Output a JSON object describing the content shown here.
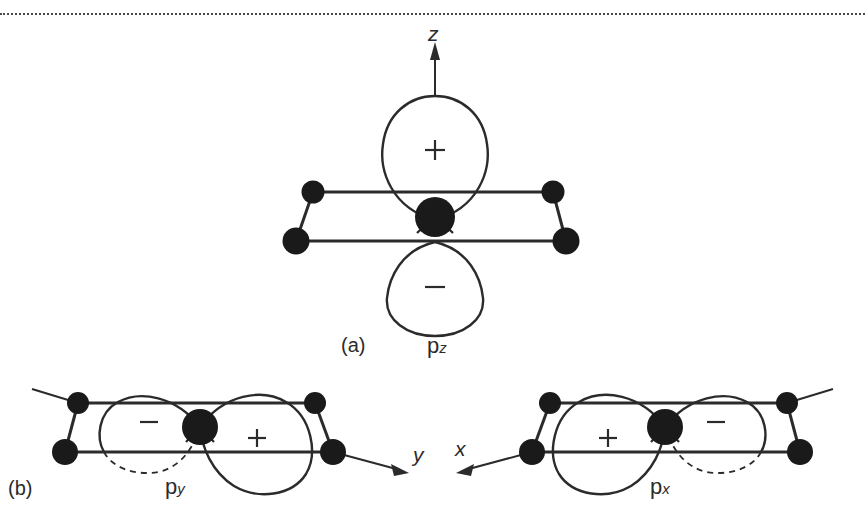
{
  "figure": {
    "type": "diagram",
    "panels": [
      {
        "id": "a",
        "panel_label": "(a)",
        "orbital_label": "p",
        "orbital_subscript": "z",
        "axis_label": "z",
        "axis_direction": "up",
        "lobes": [
          {
            "sign": "+",
            "position": "above-plane",
            "hidden": false
          },
          {
            "sign": "−",
            "position": "below-plane",
            "hidden": false
          }
        ],
        "central_atom": true,
        "corner_atoms": 4
      },
      {
        "id": "b-left",
        "panel_label": "(b)",
        "orbital_label": "p",
        "orbital_subscript": "y",
        "axis_label": "y",
        "axis_direction": "right",
        "lobes": [
          {
            "sign": "−",
            "position": "left",
            "hidden": true
          },
          {
            "sign": "+",
            "position": "right",
            "hidden": false
          }
        ],
        "central_atom": true,
        "corner_atoms": 4
      },
      {
        "id": "b-right",
        "panel_label": "",
        "orbital_label": "p",
        "orbital_subscript": "x",
        "axis_label": "x",
        "axis_direction": "left",
        "lobes": [
          {
            "sign": "+",
            "position": "left",
            "hidden": false
          },
          {
            "sign": "−",
            "position": "right",
            "hidden": true
          }
        ],
        "central_atom": true,
        "corner_atoms": 4
      }
    ]
  },
  "labels": {
    "panel_a": "(a)",
    "panel_b": "(b)",
    "p": "p",
    "sub_z": "z",
    "sub_y": "y",
    "sub_x": "x",
    "axis_z": "z",
    "axis_y": "y",
    "axis_x": "x",
    "plus": "+",
    "minus": "−"
  },
  "colors": {
    "ink": "#2b2b2b",
    "atom": "#1a1a1a",
    "background": "#ffffff",
    "rule": "#4a4a4a"
  }
}
